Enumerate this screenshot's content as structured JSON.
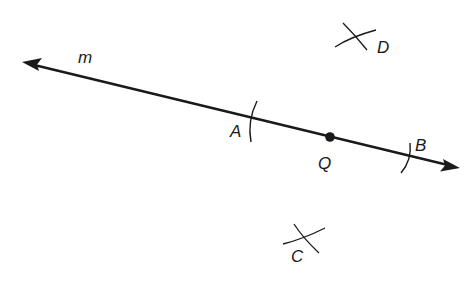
{
  "diagram": {
    "type": "geometric-construction",
    "line": {
      "label": "m",
      "from": [
        22,
        62
      ],
      "to": [
        460,
        168
      ],
      "arrows": "both"
    },
    "points": [
      {
        "label": "A",
        "type": "arc-intersection",
        "x": 253,
        "y": 121
      },
      {
        "label": "Q",
        "type": "dot",
        "x": 330,
        "y": 137
      },
      {
        "label": "B",
        "type": "arc-intersection",
        "x": 408,
        "y": 158
      },
      {
        "label": "D",
        "type": "arc-cross",
        "x": 355,
        "y": 38
      },
      {
        "label": "C",
        "type": "arc-cross",
        "x": 303,
        "y": 240
      }
    ],
    "labels": {
      "m": "m",
      "A": "A",
      "Q": "Q",
      "B": "B",
      "C": "C",
      "D": "D"
    },
    "colors": {
      "ink": "#1a1a1a",
      "background": "#ffffff"
    }
  }
}
